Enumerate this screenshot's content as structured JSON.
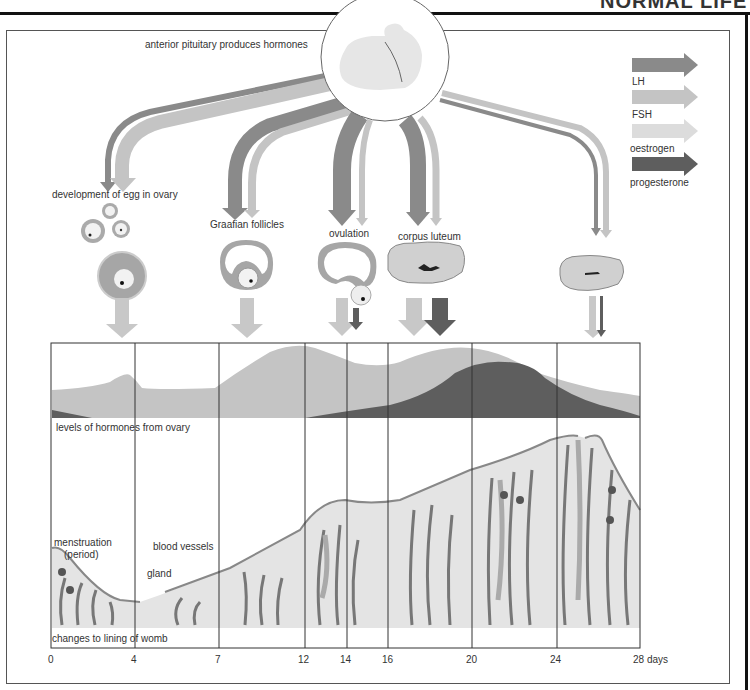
{
  "header": {
    "title_fragment": "NORMAL LIFE"
  },
  "pituitary": {
    "label": "anterior pituitary produces hormones"
  },
  "legend": {
    "items": [
      {
        "label": "LH",
        "color": "#8a8a8a"
      },
      {
        "label": "FSH",
        "color": "#c4c4c4"
      },
      {
        "label": "oestrogen",
        "color": "#dcdcdc"
      },
      {
        "label": "progesterone",
        "color": "#5e5e5e"
      }
    ]
  },
  "stages": {
    "egg_development": "development of egg in ovary",
    "graafian": "Graafian follicles",
    "ovulation": "ovulation",
    "corpus_luteum": "corpus luteum"
  },
  "hormone_panel": {
    "label": "levels of hormones from ovary"
  },
  "womb_panel": {
    "label": "changes to lining of womb",
    "menstruation": "menstruation",
    "period": "(period)",
    "blood_vessels": "blood vessels",
    "gland": "gland"
  },
  "axis": {
    "ticks": [
      "0",
      "4",
      "7",
      "12",
      "14",
      "16",
      "20",
      "24",
      "28 days"
    ]
  }
}
